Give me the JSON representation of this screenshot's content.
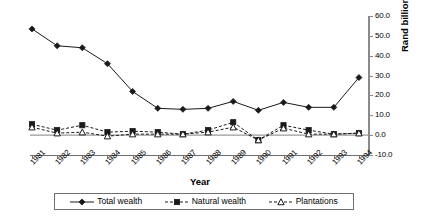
{
  "chart_data": {
    "type": "line",
    "title": "",
    "xlabel": "Year",
    "ylabel": "Rand billion",
    "ylim": [
      -10.0,
      60.0
    ],
    "yticks": [
      60.0,
      50.0,
      40.0,
      30.0,
      20.0,
      10.0,
      0.0,
      -10.0
    ],
    "ytick_labels": [
      "60.0",
      "50.0",
      "40.0",
      "30.0",
      "20.0",
      "10.0",
      "0.0",
      "-10.0"
    ],
    "grid": false,
    "legend_position": "bottom",
    "categories": [
      "1981",
      "1982",
      "1983",
      "1984",
      "1985",
      "1986",
      "1987",
      "1988",
      "1989",
      "1990",
      "1991",
      "1992",
      "1993",
      "1994"
    ],
    "series": [
      {
        "name": "Total wealth",
        "marker": "filled-diamond",
        "line_style": "solid",
        "color": "#1a1a1a",
        "values": [
          53.5,
          45.0,
          44.0,
          36.0,
          22.0,
          13.5,
          13.0,
          13.5,
          17.0,
          12.5,
          16.5,
          14.0,
          14.0,
          29.0
        ]
      },
      {
        "name": "Natural wealth",
        "marker": "filled-square",
        "line_style": "dashed",
        "color": "#1a1a1a",
        "values": [
          5.5,
          2.5,
          5.0,
          1.5,
          2.0,
          1.5,
          0.5,
          2.5,
          6.5,
          -2.5,
          5.0,
          2.5,
          0.5,
          1.0
        ]
      },
      {
        "name": "Plantations",
        "marker": "open-triangle",
        "line_style": "dashed",
        "color": "#1a1a1a",
        "values": [
          4.0,
          1.0,
          1.5,
          -0.5,
          0.5,
          0.5,
          0.5,
          1.5,
          4.0,
          -2.5,
          3.5,
          0.5,
          0.5,
          1.0
        ]
      }
    ]
  },
  "axis": {
    "x_title": "Year",
    "y_title": "Rand billion"
  },
  "legend": {
    "items": [
      {
        "label": "Total wealth",
        "marker": "filled-diamond"
      },
      {
        "label": "Natural wealth",
        "marker": "filled-square"
      },
      {
        "label": "Plantations",
        "marker": "open-triangle"
      }
    ]
  }
}
